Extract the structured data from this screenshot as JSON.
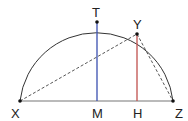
{
  "diagram": {
    "title": "",
    "colors": {
      "arc": "#333333",
      "base": "#777777",
      "tm": "#3a4fb0",
      "yh": "#c0504d",
      "dashed": "#444444",
      "point": "#111111",
      "label": "#222222"
    },
    "points": {
      "X": {
        "label": "X",
        "x": 20,
        "y": 101
      },
      "Z": {
        "label": "Z",
        "x": 173,
        "y": 101
      },
      "M": {
        "label": "M",
        "x": 97,
        "y": 101
      },
      "H": {
        "label": "H",
        "x": 137,
        "y": 101
      },
      "T": {
        "label": "T",
        "x": 97,
        "y": 22
      },
      "Y": {
        "label": "Y",
        "x": 137,
        "y": 34
      }
    },
    "segments": [
      {
        "from": "X",
        "to": "Z",
        "style": "solid",
        "color": "base"
      },
      {
        "from": "T",
        "to": "M",
        "style": "solid",
        "color": "tm"
      },
      {
        "from": "Y",
        "to": "H",
        "style": "solid",
        "color": "yh"
      },
      {
        "from": "X",
        "to": "Y",
        "style": "dashed",
        "color": "dashed"
      },
      {
        "from": "Y",
        "to": "Z",
        "style": "dashed",
        "color": "dashed"
      }
    ],
    "arc": {
      "type": "semicircle",
      "center": "M",
      "diameter": [
        "X",
        "Z"
      ]
    }
  }
}
